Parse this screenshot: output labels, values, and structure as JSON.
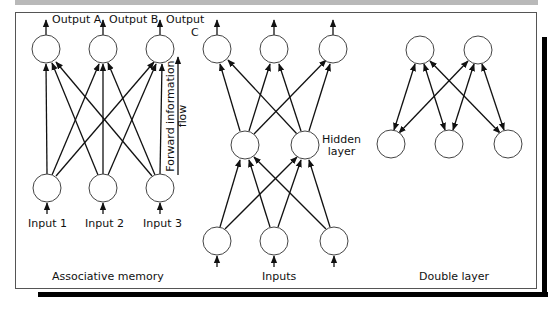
{
  "panels": {
    "associative_memory": {
      "caption": "Associative memory",
      "outputs": [
        "Output A",
        "Output B",
        "Output"
      ],
      "output_c_suffix": "C",
      "inputs": [
        "Input 1",
        "Input 2",
        "Input 3"
      ],
      "flow_label_line1": "Forward information",
      "flow_label_line2": "flow"
    },
    "hidden_layer": {
      "caption": "Inputs",
      "hidden_label_line1": "Hidden",
      "hidden_label_line2": "layer"
    },
    "double_layer": {
      "caption": "Double layer"
    }
  },
  "colors": {
    "line": "#111111",
    "node_stroke": "#444444",
    "top_bar": "#b9b9b9",
    "shadow": "#000000"
  }
}
